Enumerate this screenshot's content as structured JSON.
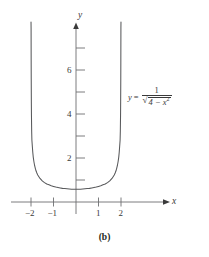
{
  "figure": {
    "caption": "(b)",
    "equation": {
      "lhs": "y",
      "equals": "=",
      "numerator": "1",
      "radical_sign": "√",
      "radicand_base": "4 − x",
      "radicand_exponent": "2"
    }
  },
  "chart_data": {
    "type": "line",
    "title": "",
    "subtitle": "",
    "xlabel": "x",
    "ylabel": "y",
    "expression": "y = 1 / sqrt(4 - x^2)",
    "xlim": [
      -2.85,
      2.85
    ],
    "ylim": [
      -0.85,
      8.4
    ],
    "xticks": [
      -2,
      -1,
      1,
      2
    ],
    "xtick_labels": [
      "−2",
      "−1",
      "1",
      "2"
    ],
    "yticks": [
      1,
      2,
      3,
      4,
      5,
      6,
      7
    ],
    "ytick_labels_shown": [
      "2",
      "4",
      "6"
    ],
    "ytick_labels_positions": [
      2,
      4,
      6
    ],
    "grid": false,
    "legend": null,
    "vertical_asymptotes": [
      -2,
      2
    ],
    "minimum_point": [
      0,
      0.5
    ],
    "curve_color": "#58595b",
    "axis_color": "#6d6e71",
    "series": [
      {
        "name": "y = 1/sqrt(4 - x^2)",
        "x": [
          -1.9992,
          -1.998,
          -1.996,
          -1.993,
          -1.99,
          -1.985,
          -1.98,
          -1.97,
          -1.96,
          -1.94,
          -1.92,
          -1.9,
          -1.87,
          -1.84,
          -1.8,
          -1.75,
          -1.7,
          -1.6,
          -1.5,
          -1.4,
          -1.3,
          -1.2,
          -1.1,
          -1.0,
          -0.9,
          -0.8,
          -0.7,
          -0.6,
          -0.5,
          -0.4,
          -0.3,
          -0.2,
          -0.1,
          0.0,
          0.1,
          0.2,
          0.3,
          0.4,
          0.5,
          0.6,
          0.7,
          0.8,
          0.9,
          1.0,
          1.1,
          1.2,
          1.3,
          1.4,
          1.5,
          1.6,
          1.7,
          1.75,
          1.8,
          1.84,
          1.87,
          1.9,
          1.92,
          1.94,
          1.96,
          1.97,
          1.98,
          1.985,
          1.99,
          1.993,
          1.996,
          1.998,
          1.9992
        ],
        "y": [
          17.68,
          11.18,
          7.91,
          6.46,
          5.59,
          4.58,
          3.95,
          3.22,
          2.81,
          2.52,
          2.25,
          2.04,
          1.83,
          1.66,
          1.49,
          1.34,
          1.23,
          1.07,
          0.96,
          0.88,
          0.82,
          0.78,
          0.74,
          0.71,
          0.68,
          0.66,
          0.64,
          0.62,
          0.61,
          0.6,
          0.59,
          0.58,
          0.58,
          0.58,
          0.58,
          0.58,
          0.59,
          0.6,
          0.61,
          0.62,
          0.64,
          0.66,
          0.68,
          0.71,
          0.74,
          0.78,
          0.82,
          0.88,
          0.96,
          1.07,
          1.23,
          1.34,
          1.49,
          1.66,
          1.83,
          2.04,
          2.25,
          2.52,
          2.81,
          3.22,
          3.95,
          4.58,
          5.59,
          6.46,
          7.91,
          11.18,
          17.68
        ]
      }
    ]
  }
}
